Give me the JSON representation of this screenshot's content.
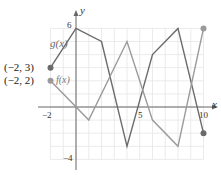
{
  "chart_data": {
    "type": "line",
    "title": "",
    "xlabel": "x",
    "ylabel": "y",
    "xlim": [
      -2,
      10
    ],
    "ylim": [
      -4,
      6
    ],
    "grid": true,
    "x_tick_labels": [
      "-2",
      "5",
      "10"
    ],
    "y_tick_labels": [
      "6",
      "-4"
    ],
    "series": [
      {
        "name": "g(x)",
        "color": "#6b6b6b",
        "x": [
          -2,
          0,
          2,
          4,
          6,
          8,
          10
        ],
        "y": [
          3,
          6,
          5,
          -3,
          4,
          6,
          -2
        ]
      },
      {
        "name": "f(x)",
        "color": "#9a9a9a",
        "x": [
          -2,
          1,
          4,
          6,
          8,
          10
        ],
        "y": [
          2,
          -1,
          5,
          -1,
          -3,
          6
        ]
      }
    ],
    "annotations": [
      "(−2, 3)",
      "(−2, 2)",
      "g(x)",
      "f(x)"
    ]
  },
  "labels": {
    "y_axis": "y",
    "x_axis": "x",
    "tick_6": "6",
    "tick_neg4": "−4",
    "tick_neg2": "−2",
    "tick_5": "5",
    "tick_10": "10",
    "g_label": "g(x)",
    "f_label": "f(x)",
    "point_g": "(−2, 3)",
    "point_f": "(−2, 2)"
  }
}
